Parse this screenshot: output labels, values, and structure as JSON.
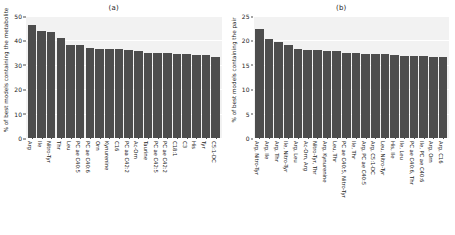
{
  "figure": {
    "width": 455,
    "height": 235,
    "bar_color": "#4d4d4d",
    "plot_background": "#f2f2f2",
    "grid_color": "#ffffff"
  },
  "chart_data": [
    {
      "type": "bar",
      "title": "(a)",
      "xlabel": "",
      "ylabel": "% of best models containing the metabolite",
      "ylim": [
        0,
        50
      ],
      "yticks": [
        0,
        10,
        20,
        30,
        40,
        50
      ],
      "grid": true,
      "legend": "none",
      "categories": [
        "Arg",
        "Ile",
        "Nitro-Tyr",
        "Thr",
        "Leu",
        "PC ae C40:5",
        "PC ae C40:6",
        "Orn",
        "Kynurenine",
        "C16",
        "PC aa C42:2",
        "Ac-Orn",
        "Taurine",
        "PC ae C42:5",
        "PC ae C42:2",
        "C18:1",
        "C3",
        "His",
        "Tyr",
        "C5:1-DC"
      ],
      "values": [
        46.4,
        43.8,
        43.6,
        40.9,
        38.1,
        38.2,
        36.9,
        36.6,
        36.6,
        36.5,
        36.1,
        35.6,
        34.9,
        34.8,
        34.8,
        34.6,
        34.4,
        34.2,
        34.1,
        33.4
      ]
    },
    {
      "type": "bar",
      "title": "(b)",
      "xlabel": "",
      "ylabel": "% of best models containing the pair",
      "ylim": [
        0,
        25
      ],
      "yticks": [
        0,
        5,
        10,
        15,
        20,
        25
      ],
      "grid": true,
      "legend": "none",
      "categories": [
        "Arg, Nitro-Tyr",
        "Arg, Ile",
        "Arg, Thr",
        "Ile, Nitro-Tyr",
        "Arg, Leu",
        "Ac-Orn, Arg",
        "Nitro-Tyr, Thr",
        "Arg, Kynurenine",
        "Leu, Thr",
        "PC ae C40:5, Nitro-Tyr",
        "Ile, Thr",
        "Arg, PC ae C40:5",
        "Arg, C5:1-DC",
        "Leu, Nitro-Tyr",
        "His, Ile",
        "Ile, Leu",
        "PC ae C40:6, Thr",
        "Ile, PC ae C40:6",
        "Arg, Orn",
        "Arg, C16"
      ],
      "values": [
        22.3,
        20.2,
        19.7,
        19.0,
        18.3,
        18.1,
        18.0,
        17.9,
        17.8,
        17.5,
        17.4,
        17.3,
        17.2,
        17.2,
        17.1,
        16.9,
        16.8,
        16.8,
        16.6,
        16.5
      ]
    }
  ]
}
